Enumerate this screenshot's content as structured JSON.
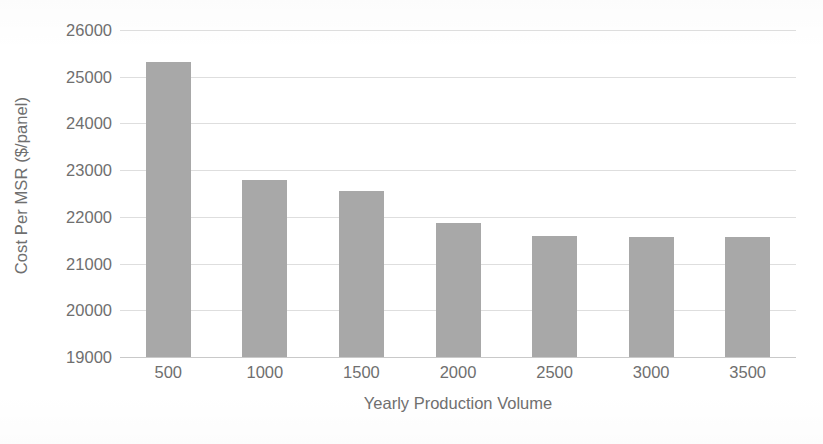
{
  "chart_data": {
    "type": "bar",
    "title": "",
    "xlabel": "Yearly Production Volume",
    "ylabel": "Cost Per MSR ($/panel)",
    "categories": [
      "500",
      "1000",
      "1500",
      "2000",
      "2500",
      "3000",
      "3500"
    ],
    "values": [
      25310,
      22800,
      22560,
      21870,
      21590,
      21570,
      21560
    ],
    "ylim": [
      19000,
      26000
    ],
    "yticks": [
      19000,
      20000,
      21000,
      22000,
      23000,
      24000,
      25000,
      26000
    ],
    "ytick_labels": [
      "19000",
      "20000",
      "21000",
      "22000",
      "23000",
      "24000",
      "25000",
      "26000"
    ],
    "grid": true,
    "legend": false,
    "legend_position": "none",
    "series": [
      {
        "name": "Cost Per MSR",
        "values": [
          25310,
          22800,
          22560,
          21870,
          21590,
          21570,
          21560
        ]
      }
    ]
  },
  "style": {
    "bar_color": "#a8a8a8",
    "grid_color": "#dedede",
    "axis_color": "#c9c9c9",
    "text_color": "#6f6f6f",
    "background": "#ffffff"
  }
}
